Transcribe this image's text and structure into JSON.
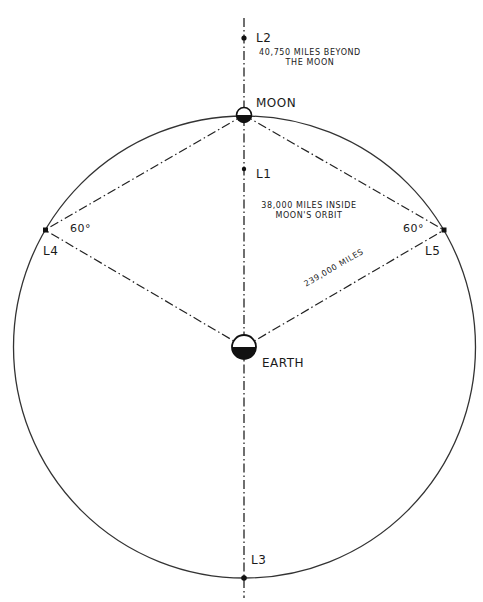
{
  "diagram": {
    "type": "lagrange-points",
    "bodies": {
      "moon": {
        "label": "MOON"
      },
      "earth": {
        "label": "EARTH"
      }
    },
    "points": {
      "L1": {
        "label": "L1",
        "note_line1": "38,000 MILES INSIDE",
        "note_line2": "MOON'S ORBIT"
      },
      "L2": {
        "label": "L2",
        "note_line1": "40,750 MILES BEYOND",
        "note_line2": "THE MOON"
      },
      "L3": {
        "label": "L3"
      },
      "L4": {
        "label": "L4",
        "angle": "60°"
      },
      "L5": {
        "label": "L5",
        "angle": "60°"
      }
    },
    "distance_label": "239,000 MILES",
    "colors": {
      "line": "#222222",
      "background": "#ffffff"
    }
  }
}
